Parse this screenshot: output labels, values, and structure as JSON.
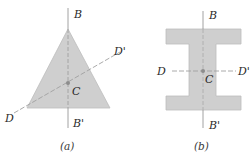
{
  "colors": {
    "shape_fill": "#cfcfcf",
    "shape_stroke": "#b8b8b8",
    "axis_line": "#8a8a8a",
    "dashed_line": "#9a9a9a",
    "centroid": "#8d8d8d",
    "text": "#2a2a2a"
  },
  "panel_a": {
    "caption": "(a)",
    "shape": "triangle",
    "labels": {
      "top": "B",
      "bottom": "B'",
      "left": "D",
      "right": "D'",
      "centroid": "C"
    }
  },
  "panel_b": {
    "caption": "(b)",
    "shape": "I-beam",
    "labels": {
      "top": "B",
      "bottom": "B'",
      "left": "D",
      "right": "D'",
      "centroid": "C"
    }
  }
}
